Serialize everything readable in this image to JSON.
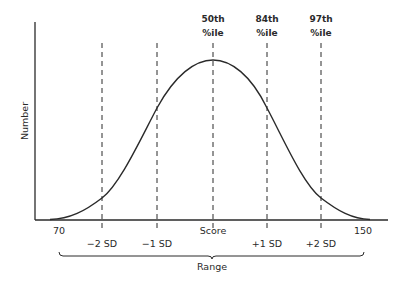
{
  "diagram": {
    "y_axis_label": "Number",
    "x_axis_min_label": "70",
    "x_axis_max_label": "150",
    "center_label": "Score",
    "range_label": "Range",
    "sd_labels": {
      "minus2": "−2 SD",
      "minus1": "−1 SD",
      "plus1": "+1 SD",
      "plus2": "+2 SD"
    },
    "percentiles": [
      {
        "line1": "50th",
        "line2": "%ile"
      },
      {
        "line1": "84th",
        "line2": "%ile"
      },
      {
        "line1": "97th",
        "line2": "%ile"
      }
    ],
    "colors": {
      "line": "#2a2a2a",
      "background": "#ffffff"
    }
  }
}
